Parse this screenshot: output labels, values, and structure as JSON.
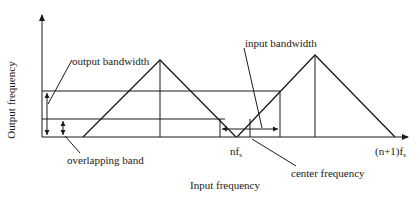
{
  "diagram": {
    "y_axis_label": "Output frequency",
    "x_axis_label": "Input frequency",
    "annotations": {
      "output_bandwidth": "output bandwidth",
      "input_bandwidth": "input bandwidth",
      "overlapping_band": "overlapping band",
      "center_frequency": "center frequency"
    },
    "x_ticks": {
      "nfs": "nf",
      "nfs_sub": "s",
      "n1fs": "(n+1)f",
      "n1fs_sub": "s"
    },
    "colors": {
      "line": "#1a1a1a",
      "background": "#ffffff"
    }
  }
}
